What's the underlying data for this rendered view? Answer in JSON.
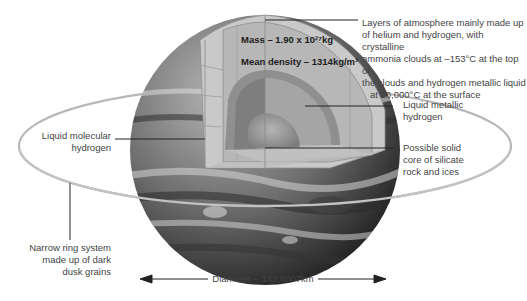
{
  "annotations": {
    "atmosphere": [
      "Layers of atmosphere mainly made up",
      "of helium and hydrogen, with crystalline",
      "ammonia clouds at –153°C at the top of",
      "the clouds and hydrogen metallic liquid",
      "at 10,000°C at the surface"
    ],
    "mass": "Mass – 1.90 x 10²⁷kg",
    "mean_density": "Mean density – 1314kg/m³",
    "liquid_molecular": [
      "Liquid molecular",
      "hydrogen"
    ],
    "liquid_metallic": [
      "Liquid metallic",
      "hydrogen"
    ],
    "core": [
      "Possible solid",
      "core of silicate",
      "rock and ices"
    ],
    "ring": [
      "Narrow ring system",
      "made up of dark",
      "dusk grains"
    ],
    "diameter": "Diameter – 142,8007km"
  },
  "colors": {
    "background": "#ffffff",
    "planet_dark": "#3c3c3c",
    "planet_mid": "#7a7a7a",
    "outer_layer": "#c8c8c8",
    "molecular_layer": "#b4b4b4",
    "metallic_layer": "#8e8e8e",
    "metallic_inner": "#a6a6a6",
    "core": "#9a9a9a",
    "ring": "#b0b0b0",
    "leader_line": "#222222",
    "text": "#444444"
  },
  "icons": {
    "arrow_left": "arrow-left-icon",
    "arrow_right": "arrow-right-icon"
  }
}
